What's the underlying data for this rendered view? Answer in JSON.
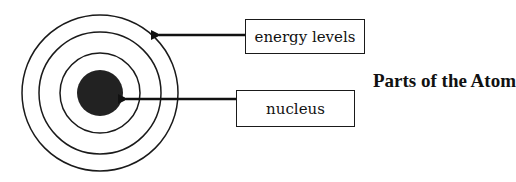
{
  "diagram": {
    "title": "Parts of the Atom",
    "labels": {
      "energy_levels": "energy levels",
      "nucleus": "nucleus"
    },
    "atom": {
      "energy_level_rings": 3,
      "nucleus_color": "#222222",
      "ring_color": "#1a1a1a"
    }
  }
}
